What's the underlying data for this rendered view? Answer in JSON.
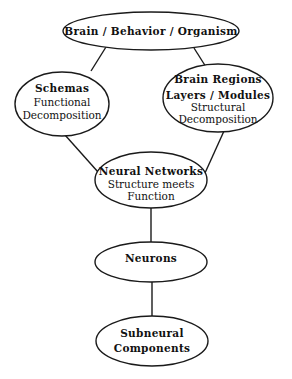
{
  "diagram": {
    "type": "hierarchy",
    "nodes": {
      "brain_behavior": {
        "lines": [
          "Brain / Behavior / Organism"
        ]
      },
      "schemas": {
        "lines": [
          "Schemas",
          "Functional",
          "Decomposition"
        ]
      },
      "brain_regions": {
        "lines": [
          "Brain Regions",
          "Layers / Modules",
          "Structural",
          "Decomposition"
        ]
      },
      "neural_networks": {
        "lines": [
          "Neural Networks",
          "Structure meets",
          "Function"
        ]
      },
      "neurons": {
        "lines": [
          "Neurons"
        ]
      },
      "subneural": {
        "lines": [
          "Subneural",
          "Components"
        ]
      }
    },
    "edges": [
      {
        "from": "Brain / Behavior / Organism",
        "to": "Schemas"
      },
      {
        "from": "Brain / Behavior / Organism",
        "to": "Brain Regions"
      },
      {
        "from": "Schemas",
        "to": "Neural Networks"
      },
      {
        "from": "Brain Regions",
        "to": "Neural Networks"
      },
      {
        "from": "Neural Networks",
        "to": "Neurons"
      },
      {
        "from": "Neurons",
        "to": "Subneural Components"
      }
    ]
  }
}
